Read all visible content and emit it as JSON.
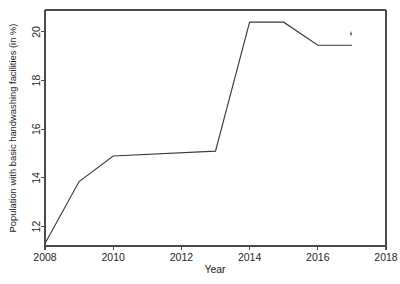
{
  "chart_data": {
    "type": "line",
    "title": "",
    "xlabel": "Year",
    "ylabel": "Population with basic handwashing facilities (in %)",
    "x": [
      2008,
      2009,
      2010,
      2013,
      2014,
      2015,
      2016,
      2017
    ],
    "values": [
      11.3,
      13.85,
      14.9,
      15.1,
      20.4,
      20.4,
      19.45,
      19.45
    ],
    "series": [
      {
        "name": "Population with basic handwashing facilities (in %)",
        "x": [
          2008,
          2009,
          2010,
          2013,
          2014,
          2015,
          2016,
          2017
        ],
        "values": [
          11.3,
          13.85,
          14.9,
          15.1,
          20.4,
          20.4,
          19.45,
          19.45
        ]
      }
    ],
    "xlim": [
      2008,
      2018
    ],
    "ylim": [
      11.2,
      20.9
    ],
    "xticks": [
      2008,
      2010,
      2012,
      2014,
      2016,
      2018
    ],
    "xtick_labels": [
      "2008",
      "2010",
      "2012",
      "2014",
      "2016",
      "2018"
    ],
    "yticks": [
      12,
      14,
      16,
      18,
      20
    ],
    "ytick_labels": [
      "12",
      "14",
      "16",
      "18",
      "20"
    ],
    "grid": false,
    "legend": "none",
    "line_color": "#3a3a3a",
    "axis_color": "#4a4a4a"
  },
  "axes": {
    "x_title": "Year",
    "y_title": "Population with basic handwashing facilities (in %)"
  }
}
